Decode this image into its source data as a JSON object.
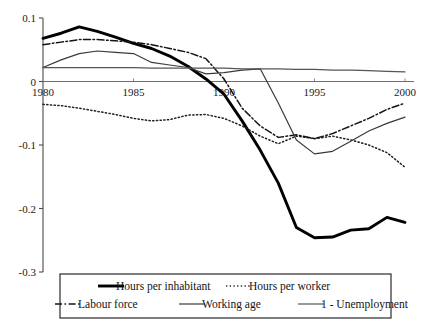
{
  "chart_data": {
    "type": "line",
    "title": "",
    "xlabel": "",
    "ylabel": "",
    "xlim": [
      1980,
      2000
    ],
    "ylim": [
      -0.3,
      0.1
    ],
    "xticks": [
      1980,
      1985,
      1990,
      1995,
      2000
    ],
    "xtick_labels": [
      "1980",
      "1985",
      "1990",
      "1995",
      "2000"
    ],
    "yticks": [
      0.1,
      0,
      -0.1,
      -0.2,
      -0.3
    ],
    "ytick_labels": [
      "0.1",
      "0",
      "-0.1",
      "-0.2",
      "-0.3"
    ],
    "grid": false,
    "legend_position": "bottom",
    "x": [
      1980,
      1981,
      1982,
      1983,
      1984,
      1985,
      1986,
      1987,
      1988,
      1989,
      1990,
      1991,
      1992,
      1993,
      1994,
      1995,
      1996,
      1997,
      1998,
      1999,
      2000
    ],
    "series": [
      {
        "name": "Hours per inhabitant",
        "style": "thick-solid",
        "color": "#000000",
        "values": [
          0.068,
          0.076,
          0.086,
          0.079,
          0.07,
          0.06,
          0.052,
          0.04,
          0.024,
          0.004,
          -0.02,
          -0.062,
          -0.108,
          -0.16,
          -0.23,
          -0.246,
          -0.245,
          -0.234,
          -0.232,
          -0.214,
          -0.222
        ]
      },
      {
        "name": "Hours per worker",
        "style": "dotted",
        "color": "#202020",
        "values": [
          -0.036,
          -0.038,
          -0.042,
          -0.047,
          -0.052,
          -0.058,
          -0.062,
          -0.06,
          -0.053,
          -0.052,
          -0.058,
          -0.07,
          -0.086,
          -0.098,
          -0.086,
          -0.09,
          -0.086,
          -0.092,
          -0.1,
          -0.112,
          -0.135
        ]
      },
      {
        "name": "Labour force",
        "style": "dash-dot",
        "color": "#141414",
        "values": [
          0.058,
          0.062,
          0.066,
          0.066,
          0.064,
          0.062,
          0.058,
          0.052,
          0.046,
          0.036,
          0.004,
          -0.042,
          -0.07,
          -0.088,
          -0.084,
          -0.09,
          -0.082,
          -0.07,
          -0.058,
          -0.044,
          -0.034
        ]
      },
      {
        "name": "Working age",
        "style": "thin-solid",
        "color": "#3a3a3a",
        "values": [
          0.022,
          0.034,
          0.044,
          0.048,
          0.046,
          0.044,
          0.03,
          0.026,
          0.022,
          0.012,
          0.014,
          0.018,
          0.02,
          -0.034,
          -0.092,
          -0.114,
          -0.11,
          -0.094,
          -0.078,
          -0.066,
          -0.056
        ]
      },
      {
        "name": "1 - Unemployment",
        "style": "thin-solid-flat",
        "color": "#555555",
        "values": [
          0.022,
          0.022,
          0.022,
          0.022,
          0.022,
          0.022,
          0.021,
          0.021,
          0.021,
          0.021,
          0.021,
          0.02,
          0.02,
          0.02,
          0.019,
          0.019,
          0.018,
          0.018,
          0.017,
          0.016,
          0.015
        ]
      }
    ],
    "legend": [
      {
        "label": "Hours per inhabitant",
        "style": "thick-solid"
      },
      {
        "label": "Hours per worker",
        "style": "dotted"
      },
      {
        "label": "Labour force",
        "style": "dash-dot"
      },
      {
        "label": "Working age",
        "style": "thin-solid"
      },
      {
        "label": "1 - Unemployment",
        "style": "thin-solid-flat"
      }
    ]
  }
}
